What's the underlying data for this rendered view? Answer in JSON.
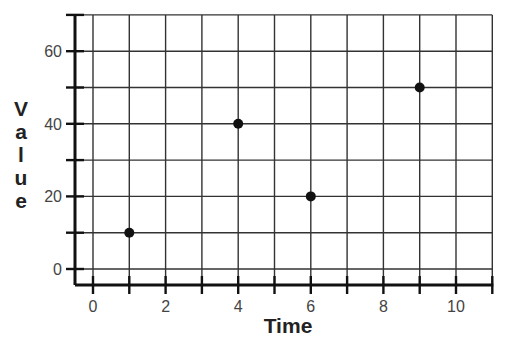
{
  "chart_data": {
    "type": "scatter",
    "title": "",
    "xlabel": "Time",
    "ylabel": "Value",
    "x": [
      1,
      4,
      6,
      9
    ],
    "y": [
      10,
      40,
      20,
      50
    ],
    "series": [
      {
        "name": "Value",
        "points": [
          [
            1,
            10
          ],
          [
            4,
            40
          ],
          [
            6,
            20
          ],
          [
            9,
            50
          ]
        ]
      }
    ],
    "x_ticks": [
      0,
      1,
      2,
      3,
      4,
      5,
      6,
      7,
      8,
      9,
      10,
      11
    ],
    "x_tick_labels": [
      "0",
      "2",
      "4",
      "6",
      "8",
      "10"
    ],
    "y_ticks": [
      0,
      10,
      20,
      30,
      40,
      50,
      60,
      70
    ],
    "y_tick_labels": [
      "0",
      "20",
      "40",
      "60"
    ],
    "xlim": [
      0,
      11
    ],
    "ylim": [
      0,
      70
    ],
    "grid": true,
    "legend": "none",
    "marker_color": "#111111",
    "grid_color": "#333333"
  }
}
